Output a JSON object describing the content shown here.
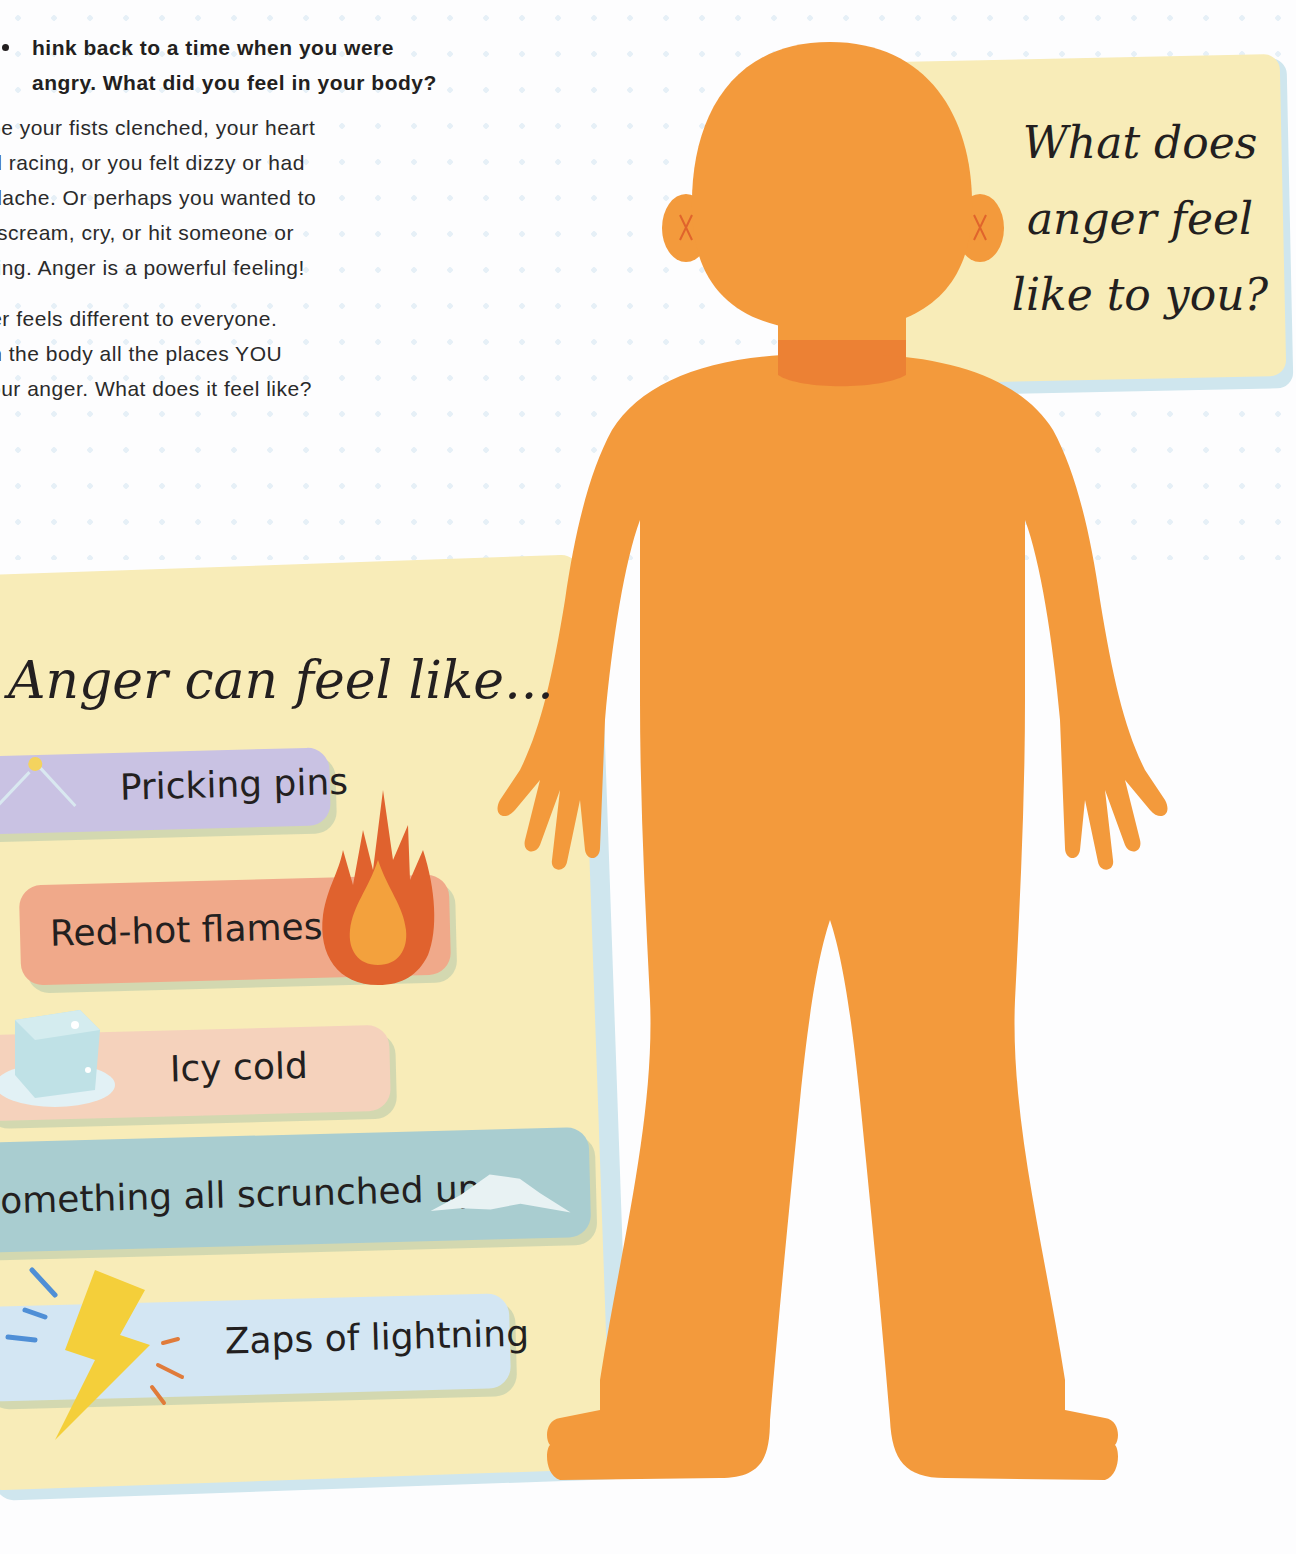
{
  "intro": {
    "question": "hink back to a time when you were angry. What did you feel in your body?",
    "paragraph1": "ybe your fists clenched, your heart\ned racing, or you felt dizzy or had\nadache. Or perhaps you wanted to\n:, scream, cry, or hit someone or\nthing. Anger is a powerful feeling!",
    "paragraph2": "ger feels different to everyone.\n on the body all the places YOU\nyour anger. What does it feel like?"
  },
  "question_card": {
    "line1": "What does",
    "line2": "anger feel",
    "line3": "like to you?"
  },
  "feelings_card": {
    "title": "Anger can feel like...",
    "items": [
      {
        "label": "Pricking pins",
        "icon": "pin-icon",
        "color": "#c9c2e3"
      },
      {
        "label": "Red-hot flames",
        "icon": "flame-icon",
        "color": "#f0a98a"
      },
      {
        "label": "Icy cold",
        "icon": "ice-cube-icon",
        "color": "#f5d2bc"
      },
      {
        "label": "omething all scrunched up",
        "icon": "crumpled-paper-icon",
        "color": "#a9cdd0"
      },
      {
        "label": "Zaps of lightning",
        "icon": "lightning-icon",
        "color": "#d3e6f3"
      }
    ]
  },
  "body_figure": {
    "color": "#f39a3c",
    "highlight_color": "#ea7b32",
    "ear_marks": [
      "X",
      "X"
    ]
  }
}
